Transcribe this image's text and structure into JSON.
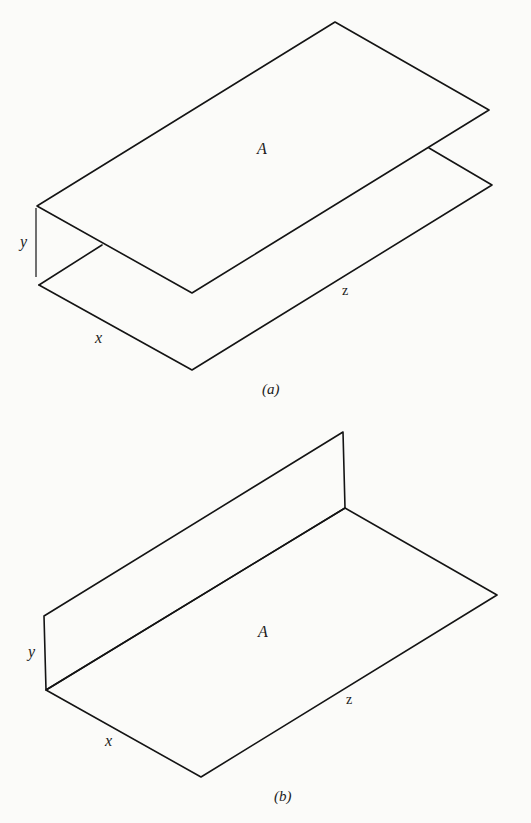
{
  "figure_a": {
    "caption": "(a)",
    "labels": {
      "area": "A",
      "x": "x",
      "y": "y",
      "z": "z"
    },
    "description": "Two parallel horizontal planes of area A separated by distance y; plane dimensions x by z"
  },
  "figure_b": {
    "caption": "(b)",
    "labels": {
      "area": "A",
      "x": "x",
      "y": "y",
      "z": "z"
    },
    "description": "Horizontal plane of area A (x by z) with perpendicular vertical plane of height y sharing edge z"
  },
  "colors": {
    "line": "#141414",
    "paper": "#fbfbf9"
  }
}
